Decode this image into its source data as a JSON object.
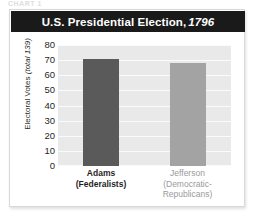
{
  "clipped_header_text": "CHART 1",
  "card": {
    "title_main": "U.S. Presidential Election,",
    "title_year": "1796"
  },
  "chart_data": {
    "type": "bar",
    "xlabel": "",
    "ylabel": "Electoral Votes (total 139)",
    "ylabel_plain": "Electoral Votes",
    "ylabel_italic": "(total 139)",
    "ylim": [
      0,
      80
    ],
    "yticks": [
      80,
      70,
      60,
      50,
      40,
      30,
      20,
      10,
      0
    ],
    "grid": true,
    "legend": "none",
    "categories": [
      {
        "name": "Adams",
        "party": "(Federalists)",
        "party_line1": "(Federalists)",
        "party_line2": ""
      },
      {
        "name": "Jefferson",
        "party": "(Democratic-Republicans)",
        "party_line1": "(Democratic-",
        "party_line2": "Republicans)"
      }
    ],
    "values": [
      71,
      68
    ],
    "colors": {
      "adams_bar": "#5a5a5a",
      "jefferson_bar": "#a3a3a3",
      "plot_background": "#e9e9e9",
      "gridline": "#fbfbfb",
      "title_bar": "#1a1a1a",
      "title_text": "#ffffff",
      "card_background": "#ffffff"
    }
  }
}
